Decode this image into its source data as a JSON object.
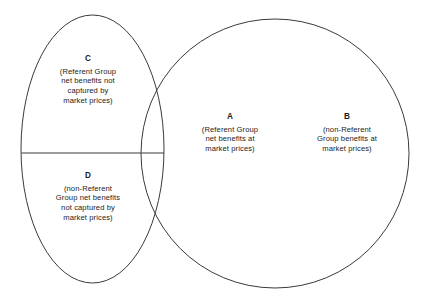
{
  "diagram": {
    "type": "venn",
    "background_color": "#ffffff",
    "stroke_color": "#3a3a3a",
    "text_color": "#1c1c1c",
    "regions": [
      {
        "key": "C",
        "description": "(Referent Group\nnet benefits not\ncaptured by\nmarket prices)"
      },
      {
        "key": "D",
        "description": "(non-Referent\nGroup net benefits\nnot captured by\nmarket prices)"
      },
      {
        "key": "A",
        "description": "(Referent Group\nnet benefits at\nmarket prices)"
      },
      {
        "key": "B",
        "description": "(non-Referent\nGroup benefits at\nmarket prices)"
      }
    ]
  }
}
